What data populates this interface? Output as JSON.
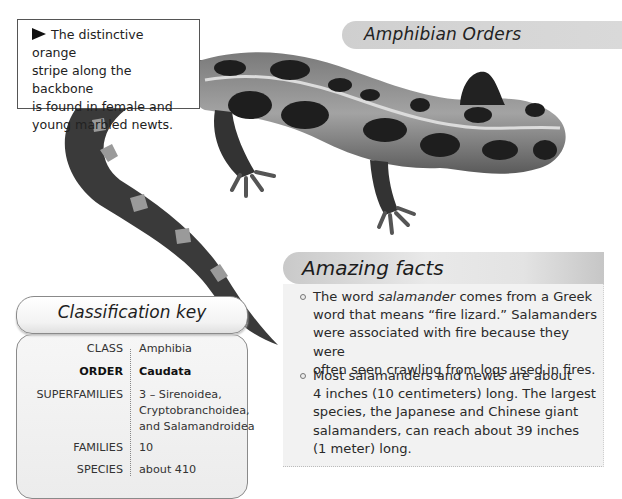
{
  "header": {
    "section_title": "Amphibian Orders"
  },
  "callout": {
    "icon": "right-triangle-icon",
    "text": "The distinctive orange stripe along the backbone is found in female and young marbled newts.",
    "lines": [
      "The distinctive orange",
      "stripe along the backbone",
      "is found in female and",
      "young marbled newts."
    ]
  },
  "image": {
    "subject": "marbled newt",
    "palette": {
      "dark": "#1a1a1a",
      "light": "#a8a8a8",
      "stripe": "#d8d8d8"
    }
  },
  "amazing_facts": {
    "title": "Amazing facts",
    "items": [
      {
        "lines": [
          [
            "The word ",
            "salamander",
            " comes from a Greek"
          ],
          "word that means “fire lizard.” Salamanders",
          "were associated with fire because they were",
          "often seen crawling from logs used in fires."
        ],
        "text": "The word salamander comes from a Greek word that means “fire lizard.” Salamanders were associated with fire because they were often seen crawling from logs used in fires."
      },
      {
        "lines": [
          "Most salamanders and newts are about",
          "4 inches (10 centimeters) long. The largest",
          "species, the Japanese and Chinese giant",
          "salamanders, can reach about 39 inches",
          "(1 meter) long."
        ],
        "text": "Most salamanders and newts are about 4 inches (10 centimeters) long. The largest species, the Japanese and Chinese giant salamanders, can reach about 39 inches (1 meter) long."
      }
    ]
  },
  "classification_key": {
    "title": "Classification key",
    "rows": [
      {
        "label": "CLASS",
        "value": "Amphibia",
        "bold": false
      },
      {
        "label": "ORDER",
        "value": "Caudata",
        "bold": true
      },
      {
        "label": "SUPERFAMILIES",
        "value_lines": [
          "3 – Sirenoidea,",
          "Cryptobranchoidea,",
          "and Salamandroidea"
        ],
        "bold": false
      },
      {
        "label": "FAMILIES",
        "value": "10",
        "bold": false
      },
      {
        "label": "SPECIES",
        "value": "about 410",
        "bold": false
      }
    ]
  }
}
